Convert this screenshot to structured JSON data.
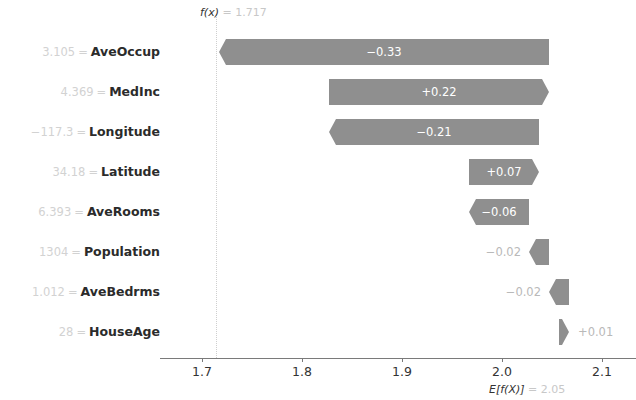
{
  "chart_data": {
    "type": "bar",
    "subtype": "shap-waterfall",
    "title": "",
    "xlabel": "",
    "ylabel": "",
    "xlim": [
      1.65,
      2.14
    ],
    "xticks": [
      "1.7",
      "1.8",
      "1.9",
      "2.0",
      "2.1"
    ],
    "xtick_values": [
      1.7,
      1.8,
      1.9,
      2.0,
      2.1
    ],
    "grid": false,
    "legend": "none",
    "base_value_label": "E[f(X)]",
    "base_value_text": "= 2.05",
    "base_value": 2.05,
    "output_label": "f(x)",
    "output_text": "= 1.717",
    "output_value": 1.717,
    "categories": [
      "AveOccup",
      "MedInc",
      "Longitude",
      "Latitude",
      "AveRooms",
      "Population",
      "AveBedrms",
      "HouseAge"
    ],
    "values": [
      -0.33,
      0.22,
      -0.21,
      0.07,
      -0.06,
      -0.02,
      -0.02,
      0.01
    ],
    "value_labels": [
      "−0.33",
      "+0.22",
      "−0.21",
      "+0.07",
      "−0.06",
      "−0.02",
      "−0.02",
      "+0.01"
    ],
    "feature_values": [
      "3.105",
      "4.369",
      "−117.3",
      "34.18",
      "6.393",
      "1304",
      "1.012",
      "28"
    ],
    "equals_sign": "=",
    "bar_color": "#8f8f8f",
    "rows": [
      {
        "feature": "AveOccup",
        "feature_value": "3.105",
        "value": -0.33,
        "value_label": "−0.33",
        "direction": "neg",
        "label_inside": true
      },
      {
        "feature": "MedInc",
        "feature_value": "4.369",
        "value": 0.22,
        "value_label": "+0.22",
        "direction": "pos",
        "label_inside": true
      },
      {
        "feature": "Longitude",
        "feature_value": "−117.3",
        "value": -0.21,
        "value_label": "−0.21",
        "direction": "neg",
        "label_inside": true
      },
      {
        "feature": "Latitude",
        "feature_value": "34.18",
        "value": 0.07,
        "value_label": "+0.07",
        "direction": "pos",
        "label_inside": true
      },
      {
        "feature": "AveRooms",
        "feature_value": "6.393",
        "value": -0.06,
        "value_label": "−0.06",
        "direction": "neg",
        "label_inside": true
      },
      {
        "feature": "Population",
        "feature_value": "1304",
        "value": -0.02,
        "value_label": "−0.02",
        "direction": "neg",
        "label_inside": false
      },
      {
        "feature": "AveBedrms",
        "feature_value": "1.012",
        "value": -0.02,
        "value_label": "−0.02",
        "direction": "neg",
        "label_inside": false
      },
      {
        "feature": "HouseAge",
        "feature_value": "28",
        "value": 0.01,
        "value_label": "+0.01",
        "direction": "pos",
        "label_inside": false
      }
    ]
  }
}
